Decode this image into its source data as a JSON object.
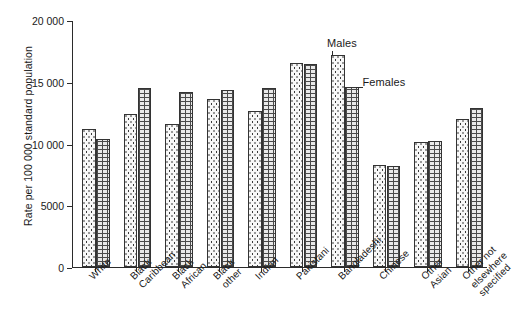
{
  "chart_data": {
    "type": "bar",
    "title": "",
    "xlabel": "",
    "ylabel": "Rate per 100 000 standard population",
    "ylim": [
      0,
      20000
    ],
    "yticks": [
      "0",
      "5000",
      "10 000",
      "15 000",
      "20 000"
    ],
    "ytick_values": [
      0,
      5000,
      10000,
      15000,
      20000
    ],
    "grid": false,
    "legend_position": "inline-annotation",
    "categories": [
      "White",
      "Black\nCaribbean",
      "Black\nAfrican",
      "Black\nother",
      "Indian",
      "Pakistani",
      "Bangladeshi",
      "Chinese",
      "Other\nAsian",
      "Other not\nelsewhere\nspecified"
    ],
    "series": [
      {
        "name": "Males",
        "pattern": "dotted",
        "values": [
          11200,
          12400,
          11600,
          13600,
          12650,
          16500,
          17200,
          8300,
          10150,
          11950
        ]
      },
      {
        "name": "Females",
        "pattern": "brick",
        "values": [
          10400,
          14500,
          14200,
          14300,
          14500,
          16400,
          14600,
          8150,
          10200,
          12900
        ]
      }
    ],
    "annotations": [
      {
        "text": "Males",
        "target": "Bangladeshi male bar"
      },
      {
        "text": "Females",
        "target": "Bangladeshi female bar"
      }
    ]
  },
  "axis": {
    "y_label": "Rate per 100 000 standard population"
  }
}
